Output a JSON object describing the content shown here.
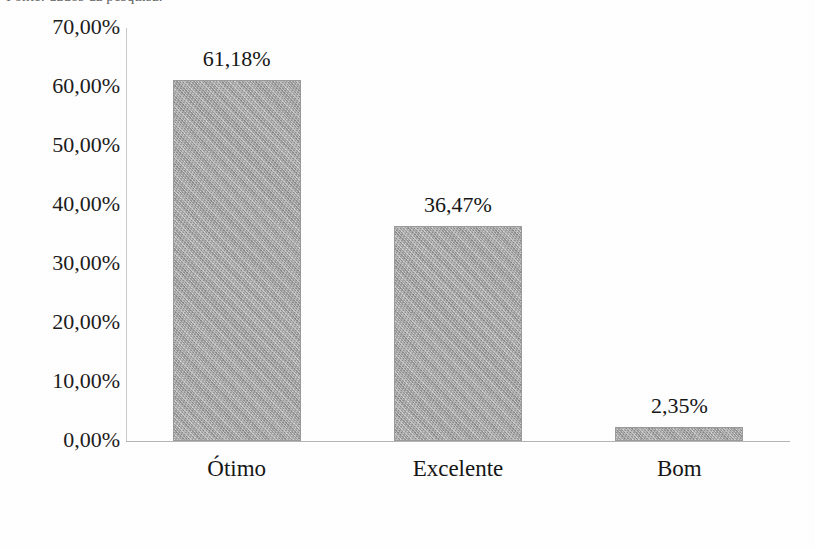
{
  "document": {
    "cut_off_caption": "Fonte: dados da pesquisa.",
    "page_background": "#ffffff"
  },
  "chart_data": {
    "type": "bar",
    "title": "",
    "subtitle": "",
    "xlabel": "",
    "ylabel": "",
    "categories": [
      "Ótimo",
      "Excelente",
      "Bom"
    ],
    "values": [
      61.18,
      36.47,
      2.35
    ],
    "value_labels": [
      "61,18%",
      "36,47%",
      "2,35%"
    ],
    "ylim": [
      0,
      70
    ],
    "ytick_values": [
      70,
      60,
      50,
      40,
      30,
      20,
      10,
      0
    ],
    "ytick_labels": [
      "70,00%",
      "60,00%",
      "50,00%",
      "40,00%",
      "30,00%",
      "20,00%",
      "10,00%",
      "0,00%"
    ],
    "grid": false,
    "legend": null,
    "legend_position": "none",
    "bar_color": "#a9a9a9",
    "bar_edge_color": "#9a9a9a",
    "axis_color": "#b5b5b5",
    "text_color": "#161616",
    "decimal_separator": ",",
    "units": "%"
  }
}
